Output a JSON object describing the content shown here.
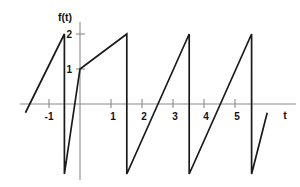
{
  "chart_data": {
    "type": "line",
    "title": "",
    "subtitle": "",
    "xlabel": "t",
    "ylabel": "f(t)",
    "xlim": [
      -1.75,
      6.0
    ],
    "ylim": [
      -2.3,
      2.4
    ],
    "grid": false,
    "legend": null,
    "period": 2,
    "amplitude_max": 2,
    "amplitude_min": -2,
    "x_ticks": [
      -1,
      1,
      2,
      3,
      4,
      5
    ],
    "x_tick_labels": [
      "-1",
      "1",
      "2",
      "3",
      "4",
      "5"
    ],
    "y_ticks": [
      1,
      2
    ],
    "y_tick_labels": [
      "1",
      "2"
    ],
    "series": [
      {
        "name": "f(t)",
        "color": "#1a1a1a",
        "points": [
          [
            -1.75,
            -0.25
          ],
          [
            -0.5,
            2.0
          ],
          [
            -0.5,
            -2.0
          ],
          [
            0.0,
            1.0
          ],
          [
            1.5,
            2.0
          ],
          [
            1.5,
            -2.0
          ],
          [
            3.5,
            2.0
          ],
          [
            3.5,
            -2.0
          ],
          [
            5.5,
            2.0
          ],
          [
            5.5,
            -2.0
          ],
          [
            6.0,
            -0.25
          ]
        ]
      }
    ]
  },
  "axes": {
    "x_axis_name": "t",
    "y_axis_name": "f(t)",
    "x_tick_labels": [
      "-1",
      "1",
      "2",
      "3",
      "4",
      "5"
    ],
    "y_tick_labels": [
      "1",
      "2"
    ]
  }
}
